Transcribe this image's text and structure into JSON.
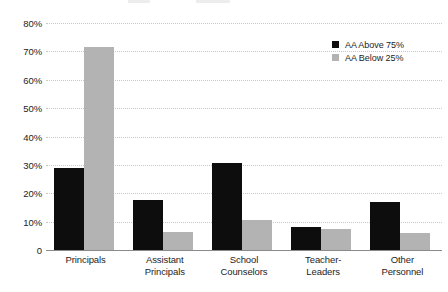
{
  "chart_data": {
    "type": "bar",
    "title": "",
    "subtitle": "",
    "xlabel": "",
    "ylabel": "",
    "categories": [
      "Principals",
      "Assistant Principals",
      "School Counselors",
      "Teacher-Leaders",
      "Other Personnel"
    ],
    "category_lines": [
      [
        "Principals"
      ],
      [
        "Assistant",
        "Principals"
      ],
      [
        "School",
        "Counselors"
      ],
      [
        "Teacher-",
        "Leaders"
      ],
      [
        "Other",
        "Personnel"
      ]
    ],
    "series": [
      {
        "name": "AA Above 75%",
        "color": "#0d0d0d",
        "values": [
          29,
          17.5,
          30.5,
          8,
          17
        ]
      },
      {
        "name": "AA Below 25%",
        "color": "#b3b3b3",
        "values": [
          71.5,
          6.5,
          10.5,
          7.5,
          6
        ]
      }
    ],
    "ylim": [
      0,
      80
    ],
    "ytick_values": [
      0,
      10,
      20,
      30,
      40,
      50,
      60,
      70,
      80
    ],
    "ytick_labels": [
      "0",
      "10%",
      "20%",
      "30%",
      "40%",
      "50%",
      "60%",
      "70%",
      "80%"
    ],
    "grid": true,
    "grid_axis": "y",
    "legend_position": "upper-right",
    "legend_entries": [
      "AA Above 75%",
      "AA Below 25%"
    ]
  },
  "legend": {
    "items": [
      {
        "label": "AA Above 75%"
      },
      {
        "label": "AA Below 25%"
      }
    ]
  }
}
